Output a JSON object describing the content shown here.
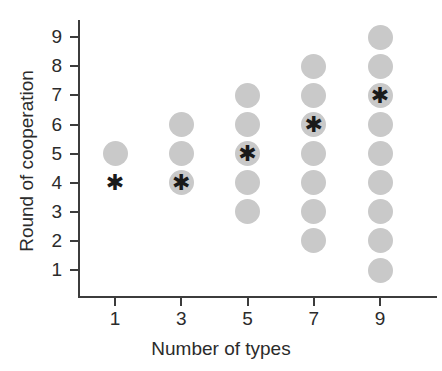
{
  "chart_data": {
    "type": "scatter",
    "title": "",
    "xlabel": "Number of types",
    "ylabel": "Round of cooperation",
    "xticks": [
      1,
      3,
      5,
      7,
      9
    ],
    "yticks": [
      1,
      2,
      3,
      4,
      5,
      6,
      7,
      8,
      9
    ],
    "xlim": [
      0,
      10
    ],
    "ylim": [
      0,
      10
    ],
    "grid": false,
    "legend": null,
    "marker_colors": {
      "dot": "#c9c9c9",
      "star": "#1a1a1a",
      "axis": "#3c3c3c",
      "text": "#2b2b2b",
      "background": "#ffffff"
    },
    "marker_notes": "Gray filled circles mark observed rounds of cooperation; black asterisk marks the highlighted (median) round for each number of types.",
    "series": [
      {
        "name": "Rounds of cooperation (dots)",
        "marker": "circle",
        "points": [
          {
            "x": 1,
            "y": 5
          },
          {
            "x": 3,
            "y": 4
          },
          {
            "x": 3,
            "y": 5
          },
          {
            "x": 3,
            "y": 6
          },
          {
            "x": 5,
            "y": 3
          },
          {
            "x": 5,
            "y": 4
          },
          {
            "x": 5,
            "y": 5
          },
          {
            "x": 5,
            "y": 6
          },
          {
            "x": 5,
            "y": 7
          },
          {
            "x": 7,
            "y": 2
          },
          {
            "x": 7,
            "y": 3
          },
          {
            "x": 7,
            "y": 4
          },
          {
            "x": 7,
            "y": 5
          },
          {
            "x": 7,
            "y": 6
          },
          {
            "x": 7,
            "y": 7
          },
          {
            "x": 7,
            "y": 8
          },
          {
            "x": 9,
            "y": 1
          },
          {
            "x": 9,
            "y": 2
          },
          {
            "x": 9,
            "y": 3
          },
          {
            "x": 9,
            "y": 4
          },
          {
            "x": 9,
            "y": 5
          },
          {
            "x": 9,
            "y": 6
          },
          {
            "x": 9,
            "y": 7
          },
          {
            "x": 9,
            "y": 8
          },
          {
            "x": 9,
            "y": 9
          }
        ]
      },
      {
        "name": "Highlighted round (asterisks)",
        "marker": "asterisk",
        "glyph": "✱",
        "points": [
          {
            "x": 1,
            "y": 4
          },
          {
            "x": 3,
            "y": 4
          },
          {
            "x": 5,
            "y": 5
          },
          {
            "x": 7,
            "y": 6
          },
          {
            "x": 9,
            "y": 7
          }
        ]
      }
    ]
  },
  "axis": {
    "x_tick_labels": [
      "1",
      "3",
      "5",
      "7",
      "9"
    ],
    "y_tick_labels": [
      "9",
      "8",
      "7",
      "6",
      "5",
      "4",
      "3",
      "2",
      "1"
    ],
    "x_title": "Number of types",
    "y_title": "Round of cooperation"
  },
  "geometry": {
    "x_origin_px": 115,
    "x_step_px": 66.25,
    "y_origin_px": 270,
    "y_step_px": 29.1,
    "dot_size_px": 25
  }
}
